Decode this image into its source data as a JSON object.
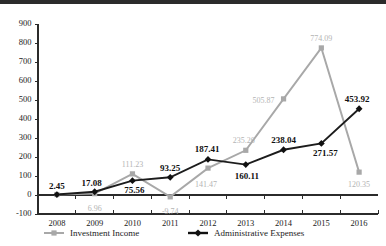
{
  "chart_data": {
    "type": "line",
    "title": "",
    "xlabel": "",
    "ylabel": "",
    "categories": [
      "2008",
      "2009",
      "2010",
      "2011",
      "2012",
      "2013",
      "2014",
      "2015",
      "2016"
    ],
    "ylim": [
      -100,
      900
    ],
    "yticks": [
      -100,
      0,
      100,
      200,
      300,
      400,
      500,
      600,
      700,
      800,
      900
    ],
    "ytick_labels": [
      "-100",
      "0",
      "100",
      "200",
      "300",
      "400",
      "500",
      "600",
      "700",
      "800",
      "900"
    ],
    "grid": false,
    "legend_position": "bottom",
    "series": [
      {
        "name": "Investment Income",
        "color": "#a8a8a8",
        "marker": "square",
        "values": [
          2.45,
          6.96,
          111.23,
          -9.74,
          141.47,
          235.26,
          505.87,
          774.09,
          120.35
        ],
        "labels": [
          "2.45",
          "6.96",
          "111.23",
          "-9.74",
          "141.47",
          "235.26",
          "505.87",
          "774.09",
          "120.35"
        ]
      },
      {
        "name": "Administrative Expenses",
        "color": "#111111",
        "marker": "diamond",
        "values": [
          2.45,
          17.08,
          75.56,
          93.25,
          187.41,
          160.11,
          238.04,
          271.57,
          453.92
        ],
        "labels": [
          "2.45",
          "17.08",
          "75.56",
          "93.25",
          "187.41",
          "160.11",
          "238.04",
          "271.57",
          "453.92"
        ]
      }
    ]
  },
  "legend": {
    "items": [
      {
        "label": "Investment Income"
      },
      {
        "label": "Administrative Expenses"
      }
    ]
  }
}
